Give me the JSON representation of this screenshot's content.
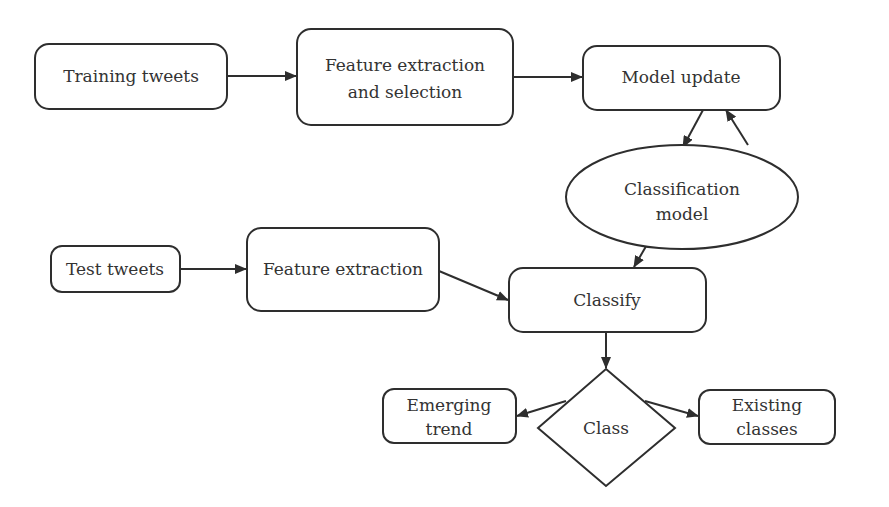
{
  "diagram": {
    "type": "flowchart",
    "nodes": {
      "training_tweets": {
        "label": "Training tweets",
        "shape": "rounded-rect"
      },
      "feature_extraction_selection": {
        "line1": "Feature extraction",
        "line2": "and selection",
        "shape": "rounded-rect"
      },
      "model_update": {
        "label": "Model update",
        "shape": "rounded-rect"
      },
      "classification_model": {
        "line1": "Classification",
        "line2": "model",
        "shape": "ellipse"
      },
      "test_tweets": {
        "label": "Test tweets",
        "shape": "rounded-rect"
      },
      "feature_extraction": {
        "label": "Feature extraction",
        "shape": "rounded-rect"
      },
      "classify": {
        "label": "Classify",
        "shape": "rounded-rect"
      },
      "class": {
        "label": "Class",
        "shape": "diamond"
      },
      "emerging_trend": {
        "line1": "Emerging",
        "line2": "trend",
        "shape": "rounded-rect"
      },
      "existing_classes": {
        "line1": "Existing",
        "line2": "classes",
        "shape": "rounded-rect"
      }
    },
    "edges": [
      {
        "from": "Training tweets",
        "to": "Feature extraction and selection"
      },
      {
        "from": "Feature extraction and selection",
        "to": "Model update"
      },
      {
        "from": "Model update",
        "to": "Classification model"
      },
      {
        "from": "Classification model",
        "to": "Model update"
      },
      {
        "from": "Classification model",
        "to": "Classify"
      },
      {
        "from": "Test tweets",
        "to": "Feature extraction"
      },
      {
        "from": "Feature extraction",
        "to": "Classify"
      },
      {
        "from": "Classify",
        "to": "Class"
      },
      {
        "from": "Class",
        "to": "Emerging trend"
      },
      {
        "from": "Class",
        "to": "Existing classes"
      }
    ],
    "colors": {
      "stroke": "#2e2e2e",
      "text": "#333333",
      "background": "#ffffff"
    }
  }
}
